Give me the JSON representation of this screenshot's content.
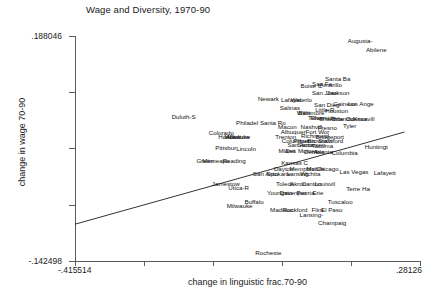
{
  "chart_data": {
    "type": "scatter",
    "title": "Wage and Diversity, 1970-90",
    "xlabel": "change in linguistic frac.70-90",
    "ylabel": "change in wage 70-90",
    "xlim": [
      -0.415514,
      0.28126
    ],
    "ylim": [
      -0.142498,
      0.188046
    ],
    "xticks": [
      "-.415514",
      ".28126"
    ],
    "yticks": [
      ".188046",
      "-.142498"
    ],
    "grid": false,
    "legend": null,
    "marker_style": "text-labels",
    "fit_line": {
      "x0": -0.415514,
      "y0": -0.0885,
      "x1": 0.25,
      "y1": 0.047
    },
    "points": [
      {
        "label": "Augusta-",
        "x": 0.1605,
        "y": 0.1805
      },
      {
        "label": "Abilene",
        "x": 0.193,
        "y": 0.168
      },
      {
        "label": "Santa Ba",
        "x": 0.115,
        "y": 0.1255
      },
      {
        "label": "San Fe",
        "x": 0.0835,
        "y": 0.118
      },
      {
        "label": "Amarillo",
        "x": 0.101,
        "y": 0.1165
      },
      {
        "label": "Boise C",
        "x": 0.062,
        "y": 0.115
      },
      {
        "label": "San Jose",
        "x": 0.089,
        "y": 0.105
      },
      {
        "label": "Jackson",
        "x": 0.116,
        "y": 0.105
      },
      {
        "label": "Newark",
        "x": -0.025,
        "y": 0.096
      },
      {
        "label": "Lafayet",
        "x": 0.021,
        "y": 0.0945
      },
      {
        "label": "Waterlo",
        "x": 0.042,
        "y": 0.0945
      },
      {
        "label": "San Dieg",
        "x": 0.093,
        "y": 0.0865
      },
      {
        "label": "Gainesv",
        "x": 0.129,
        "y": 0.0875
      },
      {
        "label": "Los Ange",
        "x": 0.162,
        "y": 0.0875
      },
      {
        "label": "Salinas",
        "x": 0.0185,
        "y": 0.0825
      },
      {
        "label": "Little R",
        "x": 0.089,
        "y": 0.079
      },
      {
        "label": "Houston",
        "x": 0.113,
        "y": 0.078
      },
      {
        "label": "Wilm",
        "x": 0.046,
        "y": 0.0745
      },
      {
        "label": "Baltimore",
        "x": 0.062,
        "y": 0.0745
      },
      {
        "label": "Duluth-S",
        "x": -0.196,
        "y": 0.069
      },
      {
        "label": "Tulsa",
        "x": 0.07,
        "y": 0.067
      },
      {
        "label": "Riverside",
        "x": 0.086,
        "y": 0.067
      },
      {
        "label": "Charlotte",
        "x": 0.102,
        "y": 0.0665
      },
      {
        "label": "Orlando",
        "x": 0.124,
        "y": 0.0665
      },
      {
        "label": "Odessa",
        "x": 0.153,
        "y": 0.066
      },
      {
        "label": "Knoxvill",
        "x": 0.168,
        "y": 0.0655
      },
      {
        "label": "Philadel",
        "x": -0.068,
        "y": 0.0605
      },
      {
        "label": "Santa Ro",
        "x": -0.016,
        "y": 0.0605
      },
      {
        "label": "Tyler",
        "x": 0.139,
        "y": 0.0565
      },
      {
        "label": "Macon",
        "x": 0.0135,
        "y": 0.054
      },
      {
        "label": "Nashvill",
        "x": 0.062,
        "y": 0.0545
      },
      {
        "label": "Fresno",
        "x": 0.094,
        "y": 0.053
      },
      {
        "label": "Albuquer",
        "x": 0.025,
        "y": 0.047
      },
      {
        "label": "Fort Wor",
        "x": 0.074,
        "y": 0.047
      },
      {
        "label": "Colorado",
        "x": -0.12,
        "y": 0.0455
      },
      {
        "label": "Honolul",
        "x": -0.105,
        "y": 0.04
      },
      {
        "label": "Milwauke",
        "x": -0.088,
        "y": 0.04
      },
      {
        "label": "Trenton",
        "x": 0.01,
        "y": 0.04
      },
      {
        "label": "Richmond",
        "x": 0.069,
        "y": 0.0405
      },
      {
        "label": "Bridgeport",
        "x": 0.099,
        "y": 0.04
      },
      {
        "label": "Allentow",
        "x": -0.087,
        "y": 0.0395
      },
      {
        "label": "Columbus",
        "x": 0.03,
        "y": 0.034
      },
      {
        "label": "Phoenix",
        "x": 0.048,
        "y": 0.034
      },
      {
        "label": "Brownsvi",
        "x": 0.079,
        "y": 0.034
      },
      {
        "label": "Stamford",
        "x": 0.101,
        "y": 0.034
      },
      {
        "label": "San Anto",
        "x": 0.039,
        "y": 0.0275
      },
      {
        "label": "Sacramen",
        "x": 0.062,
        "y": 0.0275
      },
      {
        "label": "Tacoma",
        "x": 0.084,
        "y": 0.027
      },
      {
        "label": "Lincoln",
        "x": -0.07,
        "y": 0.0215
      },
      {
        "label": "Pittsbur",
        "x": -0.111,
        "y": 0.023
      },
      {
        "label": "Miami",
        "x": 0.012,
        "y": 0.019
      },
      {
        "label": "Des Moines",
        "x": 0.042,
        "y": 0.019
      },
      {
        "label": "Denver",
        "x": 0.067,
        "y": 0.0175
      },
      {
        "label": "Atlanta",
        "x": 0.086,
        "y": 0.0175
      },
      {
        "label": "Columbia",
        "x": 0.129,
        "y": 0.016
      },
      {
        "label": "Huntingt",
        "x": 0.193,
        "y": 0.025
      },
      {
        "label": "Green",
        "x": -0.153,
        "y": 0.004
      },
      {
        "label": "Minneapo",
        "x": -0.131,
        "y": 0.004
      },
      {
        "label": "Reading",
        "x": -0.094,
        "y": 0.004
      },
      {
        "label": "Kansas C",
        "x": 0.028,
        "y": 0.002
      },
      {
        "label": "Dayton",
        "x": 0.006,
        "y": -0.0075
      },
      {
        "label": "Memphis",
        "x": 0.043,
        "y": -0.0075
      },
      {
        "label": "Mobile",
        "x": 0.07,
        "y": -0.007
      },
      {
        "label": "Chicago",
        "x": 0.094,
        "y": -0.007
      },
      {
        "label": "San Anto",
        "x": -0.031,
        "y": -0.015
      },
      {
        "label": "Spokane",
        "x": -0.004,
        "y": -0.015
      },
      {
        "label": "Lansing",
        "x": 0.034,
        "y": -0.015
      },
      {
        "label": "Wichita",
        "x": 0.06,
        "y": -0.015
      },
      {
        "label": "Las Vegas",
        "x": 0.148,
        "y": -0.011
      },
      {
        "label": "Lafayett",
        "x": 0.21,
        "y": -0.013
      },
      {
        "label": "Jamestow",
        "x": -0.111,
        "y": -0.0295
      },
      {
        "label": "Utica-R",
        "x": -0.085,
        "y": -0.0355
      },
      {
        "label": "Toledo",
        "x": 0.009,
        "y": -0.03
      },
      {
        "label": "Akron",
        "x": 0.035,
        "y": -0.03
      },
      {
        "label": "Canton",
        "x": 0.062,
        "y": -0.03
      },
      {
        "label": "Louisvil",
        "x": 0.089,
        "y": -0.03
      },
      {
        "label": "Terre Ha",
        "x": 0.156,
        "y": -0.0365
      },
      {
        "label": "Youngsto",
        "x": -0.002,
        "y": -0.043
      },
      {
        "label": "Davenpor",
        "x": 0.025,
        "y": -0.043
      },
      {
        "label": "Peoria",
        "x": 0.05,
        "y": -0.043
      },
      {
        "label": "Erie",
        "x": 0.075,
        "y": -0.043
      },
      {
        "label": "Buffalo",
        "x": -0.054,
        "y": -0.0555
      },
      {
        "label": "Milwauke",
        "x": -0.083,
        "y": -0.062
      },
      {
        "label": "Madison",
        "x": 0.002,
        "y": -0.068
      },
      {
        "label": "Rockford",
        "x": 0.029,
        "y": -0.068
      },
      {
        "label": "Flint",
        "x": 0.074,
        "y": -0.068
      },
      {
        "label": "El Paso",
        "x": 0.103,
        "y": -0.068
      },
      {
        "label": "Lansing-",
        "x": 0.062,
        "y": -0.075
      },
      {
        "label": "Tuscaloo",
        "x": 0.12,
        "y": -0.0555
      },
      {
        "label": "Champaig",
        "x": 0.104,
        "y": -0.087
      },
      {
        "label": "Rocheste",
        "x": -0.025,
        "y": -0.131
      }
    ]
  }
}
